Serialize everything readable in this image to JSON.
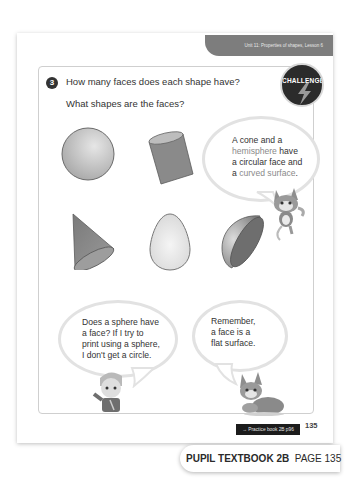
{
  "header": {
    "lesson_label": "Unit 11: Properties of shapes, Lesson 6"
  },
  "question": {
    "number": "3",
    "line1": "How many faces does each shape have?",
    "line2": "What shapes are the faces?"
  },
  "challenge_badge": {
    "label": "CHALLENGE",
    "icon": "lightning-bolt-icon"
  },
  "shapes": [
    {
      "name": "sphere"
    },
    {
      "name": "cylinder"
    },
    {
      "name": "cone"
    },
    {
      "name": "egg"
    },
    {
      "name": "hemisphere"
    }
  ],
  "bubbles": {
    "cat_top": {
      "line1": "A cone and a",
      "line2_hl": "hemisphere",
      "line2_rest": " have",
      "line3": "a circular face and",
      "line4_pre": "a ",
      "line4_hl": "curved surface",
      "line4_post": "."
    },
    "boy": {
      "line1": "Does a sphere have",
      "line2": "a face? If I try to",
      "line3": "print using a sphere,",
      "line4": "I don't get a circle."
    },
    "cat_bottom": {
      "line1": "Remember,",
      "line2": "a face is a",
      "line3": "flat surface."
    }
  },
  "footer": {
    "practice_link": "→ Practice book 2B p96",
    "page_number": "135",
    "book_title": "PUPIL TEXTBOOK 2B",
    "page_label": "PAGE 135"
  }
}
